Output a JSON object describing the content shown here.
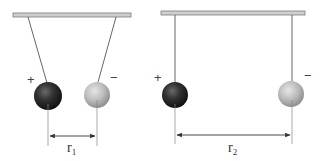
{
  "diagram": {
    "type": "coulomb-pendulum-comparison",
    "panels": [
      {
        "id": "close",
        "bar": {
          "x1": 13,
          "x2": 131,
          "y": 13,
          "h": 4
        },
        "left_ball": {
          "cx": 48,
          "cy": 96,
          "r": 14,
          "charge": "+",
          "color": "#2b2b2b",
          "string_top_x": 28
        },
        "right_ball": {
          "cx": 97,
          "cy": 95,
          "r": 13,
          "charge": "−",
          "color": "#b9b9b9",
          "string_top_x": 116
        },
        "distance_label": "r",
        "distance_subscript": "1",
        "arrow_y": 136,
        "guide_y1": 108,
        "guide_y2": 146
      },
      {
        "id": "far",
        "bar": {
          "x1": 161,
          "x2": 305,
          "y": 11,
          "h": 4
        },
        "left_ball": {
          "cx": 175,
          "cy": 95,
          "r": 13,
          "charge": "+",
          "color": "#2b2b2b",
          "string_top_x": 175
        },
        "right_ball": {
          "cx": 291,
          "cy": 94,
          "r": 13,
          "charge": "−",
          "color": "#b9b9b9",
          "string_top_x": 292
        },
        "distance_label": "r",
        "distance_subscript": "2",
        "arrow_y": 135,
        "guide_y1": 107,
        "guide_y2": 144
      }
    ],
    "labels": {
      "plus": "+",
      "minus": "−",
      "r1": "r",
      "r1_sub": "1",
      "r2": "r",
      "r2_sub": "2"
    },
    "colors": {
      "bar_fill": "#c9c9c9",
      "bar_stroke": "#7a7a7a",
      "string": "#555555",
      "guide": "#888888",
      "arrow": "#333333",
      "positive_ball": "#2b2b2b",
      "negative_ball": "#b9b9b9"
    }
  }
}
